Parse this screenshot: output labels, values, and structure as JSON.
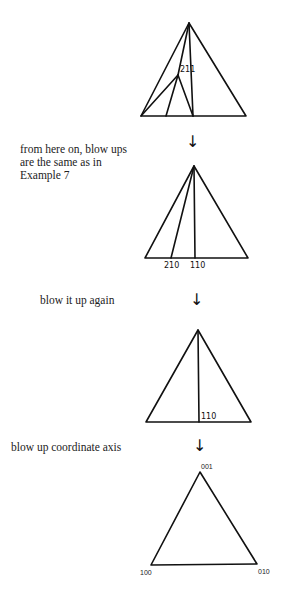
{
  "captions": {
    "step2": "from here on, blow ups\nare the same as in\nExample 7",
    "step3": "blow it up again",
    "step4": "blow up coordinate axis"
  },
  "arrows": {
    "glyph": "↓"
  },
  "triangles": [
    {
      "id": "triangle-1",
      "apex": [
        189,
        23
      ],
      "base_left": [
        141,
        116
      ],
      "base_right": [
        246,
        116
      ],
      "inner_lines": [
        {
          "from": [
            189,
            23
          ],
          "to": [
            193,
            116
          ]
        },
        {
          "from": [
            189,
            23
          ],
          "to": [
            178,
            75
          ]
        },
        {
          "from": [
            178,
            75
          ],
          "to": [
            141,
            116
          ]
        },
        {
          "from": [
            178,
            75
          ],
          "to": [
            166,
            116
          ]
        },
        {
          "from": [
            178,
            75
          ],
          "to": [
            193,
            116
          ]
        }
      ],
      "labels": [
        {
          "text": "211",
          "x": 180,
          "y": 72
        }
      ]
    },
    {
      "id": "triangle-2",
      "apex": [
        194,
        166
      ],
      "base_left": [
        145,
        258
      ],
      "base_right": [
        248,
        258
      ],
      "inner_lines": [
        {
          "from": [
            194,
            166
          ],
          "to": [
            171,
            258
          ]
        },
        {
          "from": [
            194,
            166
          ],
          "to": [
            195,
            258
          ]
        }
      ],
      "labels": [
        {
          "text": "210",
          "x": 164,
          "y": 268
        },
        {
          "text": "110",
          "x": 190,
          "y": 268
        }
      ]
    },
    {
      "id": "triangle-3",
      "apex": [
        198,
        330
      ],
      "base_left": [
        146,
        422
      ],
      "base_right": [
        251,
        422
      ],
      "inner_lines": [
        {
          "from": [
            198,
            330
          ],
          "to": [
            199,
            422
          ]
        }
      ],
      "labels": [
        {
          "text": "110",
          "x": 201,
          "y": 419
        }
      ]
    },
    {
      "id": "triangle-4",
      "apex": [
        200,
        472
      ],
      "base_left": [
        151,
        565
      ],
      "base_right": [
        257,
        564
      ],
      "inner_lines": [],
      "labels": [
        {
          "text": "001",
          "x": 201,
          "y": 469
        },
        {
          "text": "100",
          "x": 140,
          "y": 575
        },
        {
          "text": "010",
          "x": 258,
          "y": 574
        }
      ]
    }
  ]
}
